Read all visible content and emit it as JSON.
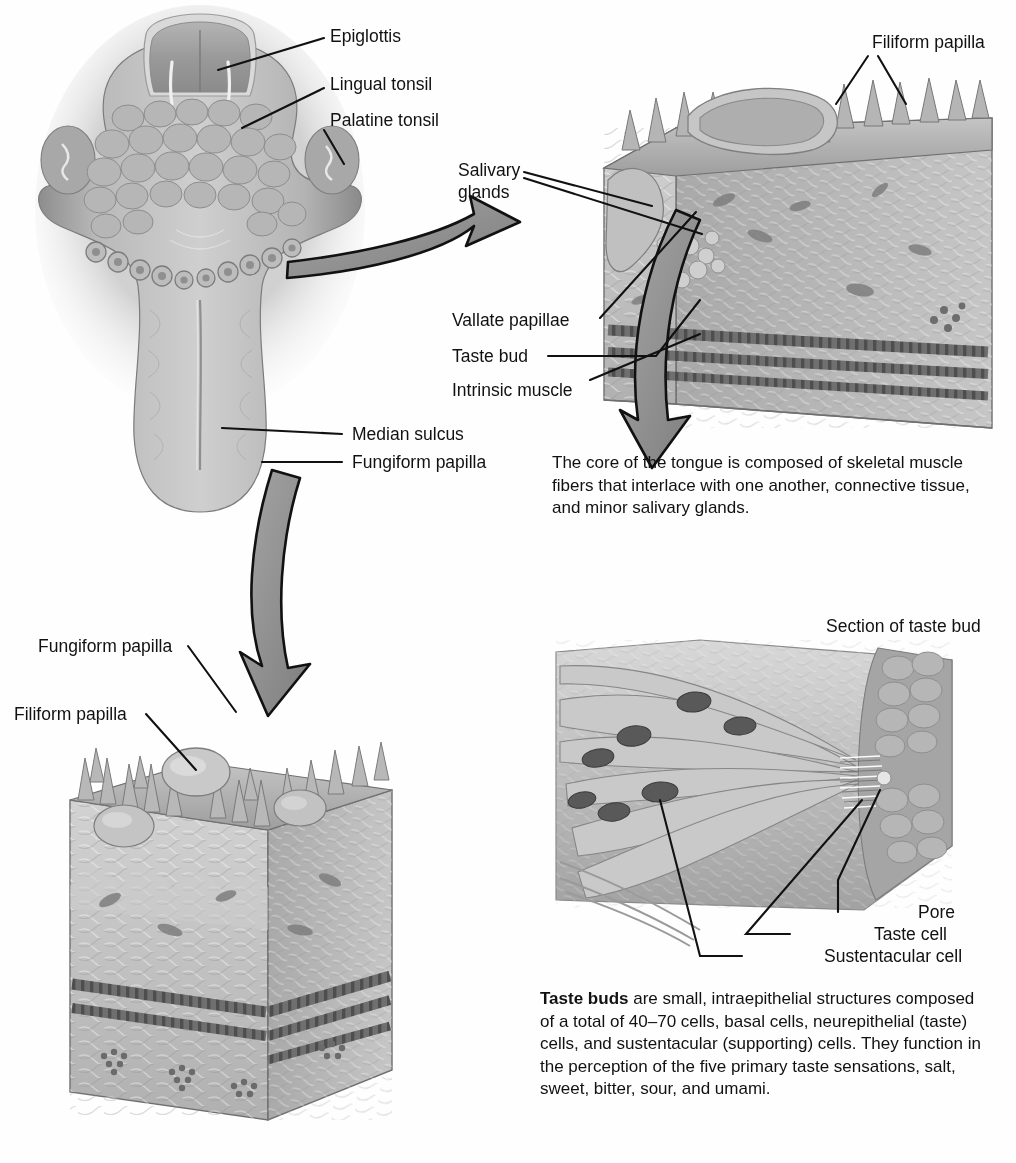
{
  "figure": {
    "background": "#ffffff",
    "ink": "#111111",
    "arrow_fill": "#8f8f8f",
    "arrow_stroke": "#111111"
  },
  "labels": {
    "epiglottis": "Epiglottis",
    "lingual_tonsil": "Lingual tonsil",
    "palatine_tonsil": "Palatine tonsil",
    "filiform_papilla_top": "Filiform papilla",
    "salivary_glands_l1": "Salivary",
    "salivary_glands_l2": "glands",
    "vallate_papillae": "Vallate papillae",
    "taste_bud": "Taste bud",
    "intrinsic_muscle": "Intrinsic muscle",
    "median_sulcus": "Median sulcus",
    "fungiform_papilla_right": "Fungiform papilla",
    "fungiform_papilla_bl": "Fungiform papilla",
    "filiform_papilla_bl": "Filiform papilla",
    "section_of_taste_bud": "Section of taste bud",
    "pore": "Pore",
    "taste_cell": "Taste cell",
    "sustentacular_cell": "Sustentacular cell"
  },
  "captions": {
    "core_of_tongue": "The core of the tongue is composed of skeletal muscle fibers that interlace with one another, connective tissue, and minor salivary glands.",
    "taste_buds_lead": "Taste buds",
    "taste_buds_rest": " are small, intraepithelial structures composed of a total of 40–70 cells, basal cells, neurepithelial (taste) cells, and sustentacular (supporting) cells. They function in the perception of the five primary taste sensations, salt, sweet, bitter, sour, and umami."
  },
  "panels": {
    "dorsal_tongue": "dorsal-view-of-tongue",
    "vallate_block": "vallate-papilla-tissue-block",
    "fungiform_block": "fungiform-filiform-tissue-block",
    "taste_bud_section": "taste-bud-section"
  }
}
